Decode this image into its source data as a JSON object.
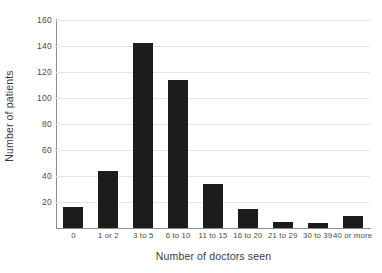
{
  "chart_data": {
    "type": "bar",
    "title": "",
    "xlabel": "Number of doctors seen",
    "ylabel": "Number of patients",
    "categories": [
      "0",
      "1 or 2",
      "3 to 5",
      "6 to 10",
      "11 to 15",
      "16 to 20",
      "21 to 29",
      "30 to 39",
      "40 or more"
    ],
    "values": [
      16,
      44,
      142,
      114,
      34,
      15,
      5,
      4,
      9
    ],
    "ylim": [
      0,
      160
    ],
    "yticks": [
      0,
      20,
      40,
      60,
      80,
      100,
      120,
      140,
      160
    ],
    "ytick_labels": [
      "0",
      "20",
      "40",
      "60",
      "80",
      "100",
      "120",
      "140",
      "160"
    ],
    "grid": true,
    "grid_axis": "y",
    "legend": false,
    "legend_position": "none",
    "bar_color": "#1c1c1c",
    "grid_color": "#e4e4e4",
    "axis_color": "#8d8d8d",
    "background_color": "#ffffff",
    "text_color": "#3b3b3b"
  }
}
